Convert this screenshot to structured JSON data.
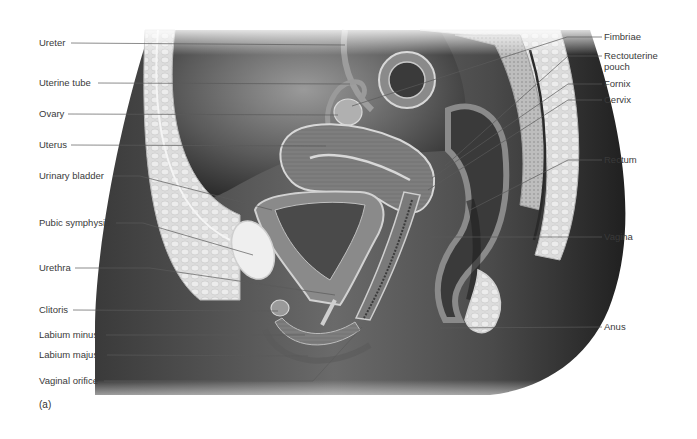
{
  "figure": {
    "panel_letter": "(a)",
    "colors": {
      "background": "#ffffff",
      "skin_dark": "#2f2f2f",
      "tissue_mid": "#8a8a8a",
      "tissue_light": "#d9d9d9",
      "fat": "#e8e8e8",
      "leader_line": "#5a5a5a",
      "label_text": "#3a3a3a"
    },
    "left_labels": [
      {
        "text": "Ureter",
        "y": 43,
        "line_end": [
          345,
          45
        ]
      },
      {
        "text": "Uterine tube",
        "y": 83,
        "line_end": [
          350,
          84
        ]
      },
      {
        "text": "Ovary",
        "y": 114,
        "line_end": [
          338,
          115
        ]
      },
      {
        "text": "Uterus",
        "y": 145,
        "line_end": [
          326,
          146
        ]
      },
      {
        "text": "Urinary bladder",
        "y": 176,
        "line_end": [
          272,
          210
        ]
      },
      {
        "text": "Pubic symphysis",
        "y": 223,
        "line_end": [
          253,
          255
        ]
      },
      {
        "text": "Urethra",
        "y": 268,
        "line_end": [
          335,
          295
        ]
      },
      {
        "text": "Clitoris",
        "y": 310,
        "line_end": [
          278,
          311
        ]
      },
      {
        "text": "Labium minus",
        "y": 335,
        "line_end": [
          305,
          335
        ]
      },
      {
        "text": "Labium majus",
        "y": 355,
        "line_end": [
          308,
          356
        ]
      },
      {
        "text": "Vaginal orifice",
        "y": 381,
        "line_end": [
          362,
          327
        ]
      }
    ],
    "right_labels": [
      {
        "text": "Fimbriae",
        "y": 37,
        "line_end": [
          352,
          106
        ]
      },
      {
        "text": "Rectouterine\npouch",
        "y": 56,
        "line_end": [
          445,
          166
        ]
      },
      {
        "text": "Fornix",
        "y": 84,
        "line_end": [
          432,
          178
        ]
      },
      {
        "text": "Cervix",
        "y": 100,
        "line_end": [
          428,
          190
        ]
      },
      {
        "text": "Rectum",
        "y": 160,
        "line_end": [
          470,
          210
        ]
      },
      {
        "text": "Vagina",
        "y": 237,
        "line_end": [
          416,
          237
        ]
      },
      {
        "text": "Anus",
        "y": 327,
        "line_end": [
          440,
          328
        ]
      }
    ]
  }
}
